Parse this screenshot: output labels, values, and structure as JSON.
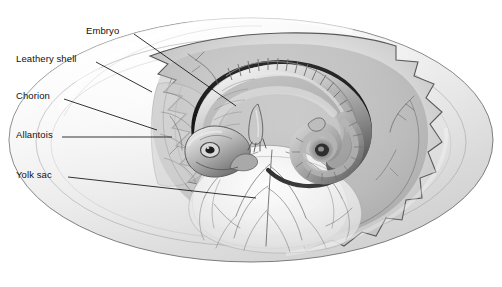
{
  "figure": {
    "background_color": "#ffffff",
    "line_color": "#111111",
    "shell_fill": "#e8e8e8",
    "shell_edge": "#6b6b6b",
    "membrane_fill": "#d9d9d9",
    "yolk_fill": "#f2f2f2",
    "vessel_color": "#777777",
    "embryo_dark": "#4a4a4a",
    "embryo_mid": "#9a9a9a",
    "embryo_light": "#dcdcdc"
  },
  "labels": [
    {
      "id": "embryo",
      "text": "Embryo",
      "leader": {
        "x1": 134,
        "y1": 34,
        "x2": 236,
        "y2": 106
      }
    },
    {
      "id": "leathery_shell",
      "text": "Leathery shell",
      "leader": {
        "x1": 96,
        "y1": 62,
        "x2": 152,
        "y2": 92
      }
    },
    {
      "id": "chorion",
      "text": "Chorion",
      "leader": {
        "x1": 64,
        "y1": 99,
        "x2": 157,
        "y2": 130
      }
    },
    {
      "id": "allantois",
      "text": "Allantois",
      "leader": {
        "x1": 62,
        "y1": 137,
        "x2": 172,
        "y2": 137
      }
    },
    {
      "id": "yolk_sac",
      "text": "Yolk sac",
      "leader": {
        "x1": 68,
        "y1": 177,
        "x2": 256,
        "y2": 198
      }
    }
  ],
  "structures": {
    "egg_outline": "large horizontal ellipse, leathery shell",
    "cut_edge": "jagged torn shell margin revealing interior",
    "embryo_pose": "curled reptile embryo, head lower-left with large eye, somites along dorsal ridge, tail coiled at right",
    "yolk_sac": "large pale sac occupying lower center, covered by branching vitelline blood vessels"
  }
}
